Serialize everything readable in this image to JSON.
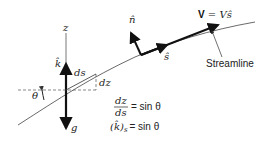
{
  "diagram": {
    "type": "streamline-coordinate-geometry",
    "axis_labels": {
      "z": "z",
      "k_hat": "k̂",
      "g": "g",
      "n_hat": "n̂",
      "s_hat": "ŝ",
      "theta": "θ",
      "ds": "ds",
      "dz": "dz"
    },
    "velocity": {
      "bold": "V",
      "equals": " = Vŝ"
    },
    "streamline_label": "Streamline",
    "equations": {
      "eq1_numerator": "dz",
      "eq1_denominator": "ds",
      "eq1_rhs": "= sin θ",
      "eq2_lhs": "(k̂)",
      "eq2_sub": "s",
      "eq2_rhs": "= sin θ"
    },
    "colors": {
      "line": "#222222",
      "background": "#ffffff"
    }
  }
}
